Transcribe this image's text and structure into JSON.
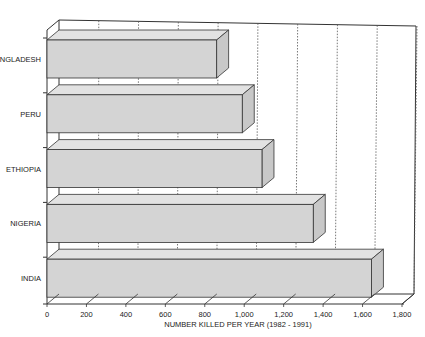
{
  "chart_data": {
    "type": "bar",
    "orientation": "horizontal",
    "style": "3d",
    "title": "",
    "xlabel": "NUMBER KILLED PER YEAR (1982 - 1991)",
    "ylabel": "",
    "categories": [
      "BANGLADESH",
      "PERU",
      "ETHIOPIA",
      "NIGERIA",
      "INDIA"
    ],
    "values": [
      860,
      990,
      1090,
      1350,
      1645
    ],
    "xlim": [
      0,
      1800
    ],
    "x_ticks": [
      "0",
      "200",
      "400",
      "600",
      "800",
      "1,000",
      "1,200",
      "1,400",
      "1,600",
      "1,800"
    ],
    "grid": "dashed vertical lines on back wall",
    "legend": "none"
  },
  "colors": {
    "bar_fill": "#d4d4d4",
    "bar_top": "#e2e2e2",
    "bar_side": "#c8c8c8",
    "outline": "#333333",
    "grid": "#555555"
  }
}
